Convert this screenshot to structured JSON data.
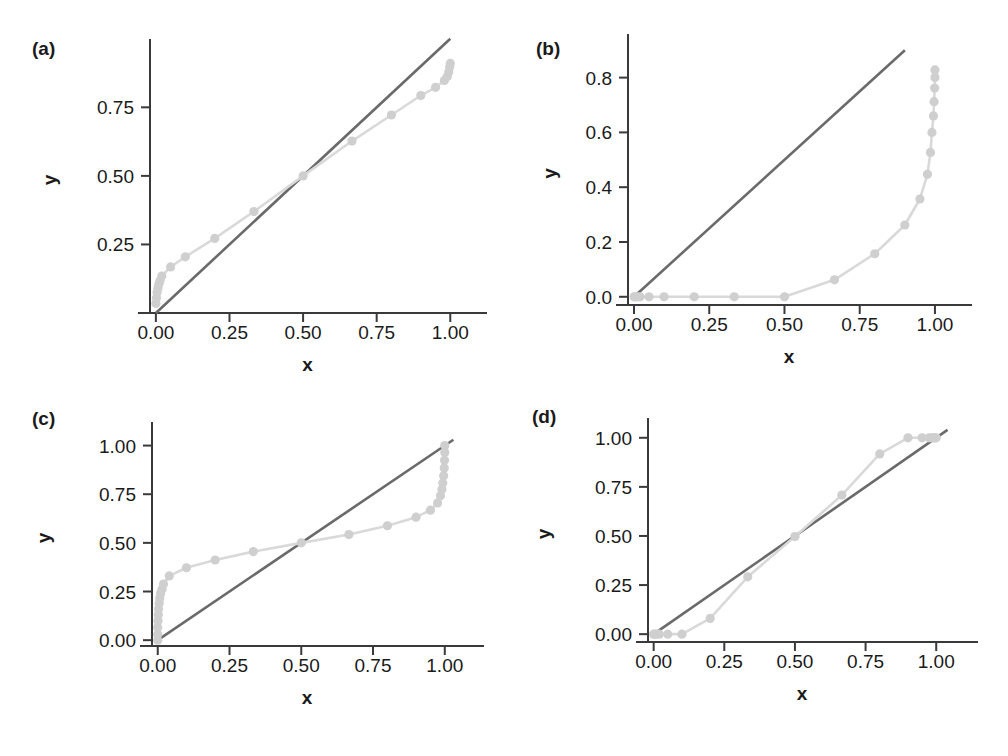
{
  "figure": {
    "width": 1008,
    "height": 756,
    "background": "#ffffff",
    "identity_line_color": "#6a6a6a",
    "data_line_color": "#d9d9d9",
    "marker_color": "#cfcfcf",
    "axis_color": "#3a3a3a",
    "text_color": "#1a1a1a"
  },
  "panels": [
    {
      "key": "a",
      "label": "(a)"
    },
    {
      "key": "b",
      "label": "(b)"
    },
    {
      "key": "c",
      "label": "(c)"
    },
    {
      "key": "d",
      "label": "(d)"
    }
  ],
  "chart_data": [
    {
      "panel": "(a)",
      "type": "scatter",
      "title": "",
      "xlabel": "x",
      "ylabel": "y",
      "xlim": [
        -0.02,
        1.05
      ],
      "ylim": [
        0.0,
        0.97
      ],
      "xticks": [
        0.0,
        0.25,
        0.5,
        0.75,
        1.0
      ],
      "xticklabels": [
        "0.00",
        "0.25",
        "0.50",
        "0.75",
        "1.00"
      ],
      "yticks": [
        0.25,
        0.5,
        0.75
      ],
      "yticklabels": [
        "0.25",
        "0.50",
        "0.75"
      ],
      "grid": false,
      "legend": "none",
      "series": [
        {
          "name": "identity-line",
          "type": "line",
          "x": [
            0.0,
            1.0
          ],
          "y": [
            0.0,
            1.0
          ]
        },
        {
          "name": "pp-curve",
          "type": "line+markers",
          "x": [
            0.0,
            0.002,
            0.004,
            0.007,
            0.01,
            0.014,
            0.02,
            0.05,
            0.1,
            0.2,
            0.333,
            0.5,
            0.666,
            0.8,
            0.9,
            0.95,
            0.98,
            0.99,
            0.995,
            0.998,
            1.0
          ],
          "y": [
            0.035,
            0.055,
            0.075,
            0.09,
            0.105,
            0.118,
            0.135,
            0.168,
            0.205,
            0.272,
            0.37,
            0.5,
            0.627,
            0.722,
            0.793,
            0.823,
            0.848,
            0.862,
            0.88,
            0.898,
            0.91
          ]
        }
      ]
    },
    {
      "panel": "(b)",
      "type": "scatter",
      "title": "",
      "xlabel": "x",
      "ylabel": "y",
      "xlim": [
        -0.02,
        1.05
      ],
      "ylim": [
        -0.03,
        0.93
      ],
      "xticks": [
        0.0,
        0.25,
        0.5,
        0.75,
        1.0
      ],
      "xticklabels": [
        "0.00",
        "0.25",
        "0.50",
        "0.75",
        "1.00"
      ],
      "yticks": [
        0.0,
        0.2,
        0.4,
        0.6,
        0.8
      ],
      "yticklabels": [
        "0.0",
        "0.2",
        "0.4",
        "0.6",
        "0.8"
      ],
      "grid": false,
      "legend": "none",
      "series": [
        {
          "name": "identity-line",
          "type": "line",
          "x": [
            0.0,
            0.9
          ],
          "y": [
            0.0,
            0.9
          ]
        },
        {
          "name": "pp-curve",
          "type": "line+markers",
          "x": [
            0.0,
            0.005,
            0.01,
            0.02,
            0.05,
            0.1,
            0.2,
            0.333,
            0.5,
            0.666,
            0.8,
            0.9,
            0.95,
            0.975,
            0.985,
            0.99,
            0.995,
            0.997,
            0.999,
            1.0,
            1.0
          ],
          "y": [
            0.0,
            0.0,
            0.0,
            0.0,
            0.0,
            0.0,
            0.0,
            0.0,
            0.0,
            0.062,
            0.157,
            0.262,
            0.357,
            0.447,
            0.527,
            0.6,
            0.66,
            0.712,
            0.762,
            0.8,
            0.828
          ]
        }
      ]
    },
    {
      "panel": "(c)",
      "type": "scatter",
      "title": "",
      "xlabel": "x",
      "ylabel": "y",
      "xlim": [
        -0.02,
        1.06
      ],
      "ylim": [
        -0.03,
        1.08
      ],
      "xticks": [
        0.0,
        0.25,
        0.5,
        0.75,
        1.0
      ],
      "xticklabels": [
        "0.00",
        "0.25",
        "0.50",
        "0.75",
        "1.00"
      ],
      "yticks": [
        0.0,
        0.25,
        0.5,
        0.75,
        1.0
      ],
      "yticklabels": [
        "0.00",
        "0.25",
        "0.50",
        "0.75",
        "1.00"
      ],
      "grid": false,
      "legend": "none",
      "series": [
        {
          "name": "identity-line",
          "type": "line",
          "x": [
            0.0,
            1.03
          ],
          "y": [
            0.0,
            1.03
          ]
        },
        {
          "name": "pp-curve",
          "type": "line+markers",
          "x": [
            0.0,
            0.0,
            0.0,
            0.001,
            0.002,
            0.003,
            0.005,
            0.007,
            0.01,
            0.015,
            0.02,
            0.04,
            0.1,
            0.2,
            0.333,
            0.5,
            0.666,
            0.8,
            0.9,
            0.95,
            0.975,
            0.985,
            0.99,
            0.993,
            0.996,
            0.998,
            0.999,
            1.0,
            1.0
          ],
          "y": [
            0.0,
            0.03,
            0.065,
            0.1,
            0.13,
            0.16,
            0.19,
            0.215,
            0.24,
            0.262,
            0.288,
            0.33,
            0.372,
            0.412,
            0.455,
            0.5,
            0.543,
            0.588,
            0.632,
            0.668,
            0.705,
            0.742,
            0.775,
            0.808,
            0.845,
            0.885,
            0.925,
            0.965,
            1.0
          ]
        }
      ]
    },
    {
      "panel": "(d)",
      "type": "scatter",
      "title": "",
      "xlabel": "x",
      "ylabel": "y",
      "xlim": [
        -0.02,
        1.07
      ],
      "ylim": [
        -0.04,
        1.06
      ],
      "xticks": [
        0.0,
        0.25,
        0.5,
        0.75,
        1.0
      ],
      "xticklabels": [
        "0.00",
        "0.25",
        "0.50",
        "0.75",
        "1.00"
      ],
      "yticks": [
        0.0,
        0.25,
        0.5,
        0.75,
        1.0
      ],
      "yticklabels": [
        "0.00",
        "0.25",
        "0.50",
        "0.75",
        "1.00"
      ],
      "grid": false,
      "legend": "none",
      "series": [
        {
          "name": "identity-line",
          "type": "line",
          "x": [
            0.0,
            1.04
          ],
          "y": [
            0.0,
            1.04
          ]
        },
        {
          "name": "pp-curve",
          "type": "line+markers",
          "x": [
            0.0,
            0.005,
            0.01,
            0.02,
            0.05,
            0.1,
            0.2,
            0.333,
            0.5,
            0.666,
            0.8,
            0.9,
            0.95,
            0.975,
            0.985,
            0.992,
            0.996,
            1.0
          ],
          "y": [
            0.0,
            0.0,
            0.0,
            0.0,
            0.0,
            0.0,
            0.08,
            0.292,
            0.497,
            0.708,
            0.918,
            1.0,
            1.0,
            1.0,
            1.0,
            1.0,
            1.0,
            1.0
          ]
        }
      ]
    }
  ]
}
